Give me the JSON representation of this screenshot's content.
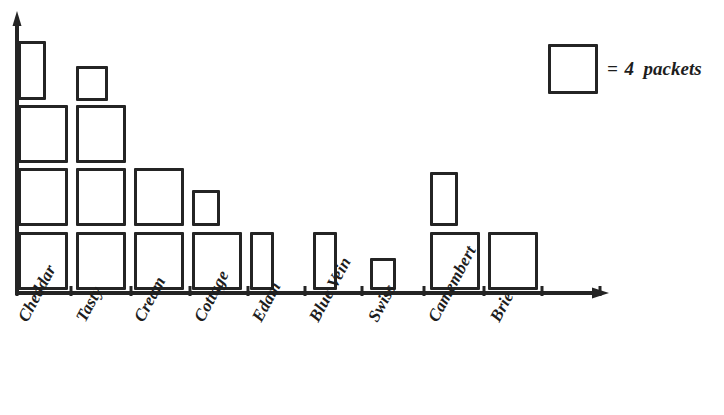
{
  "figure": {
    "kind": "pictograph",
    "ink_color": "#242424",
    "background": "#ffffff"
  },
  "legend": {
    "symbol_name": "packet-square-symbol",
    "equals_sign": "=",
    "value_text": "4",
    "unit_text": "packets",
    "full_text": "= 4  packets"
  },
  "axes": {
    "x_axis_name": "cheese-type-axis",
    "y_axis_name": "packet-count-axis",
    "x_arrow": true,
    "y_arrow": true,
    "gridlines": false,
    "tick_labels": []
  },
  "chart_data": {
    "type": "bar",
    "title": "",
    "subtitle": "",
    "xlabel": "",
    "ylabel": "",
    "legend_position": "top-right",
    "grid": false,
    "symbol_value": 4,
    "symbol_unit": "packets",
    "ylim": [
      0,
      16
    ],
    "categories": [
      "Cheddar",
      "Tasty",
      "Cream",
      "Cottage",
      "Edam",
      "Blue Vein",
      "Swiss",
      "Camembert",
      "Brie"
    ],
    "symbols": [
      3.5,
      3.4,
      2.5,
      1.4,
      0.5,
      0.5,
      0.4,
      1.5,
      1
    ],
    "values": [
      14,
      13,
      10,
      6,
      2,
      2,
      2,
      6,
      4
    ],
    "series": [
      {
        "name": "Packets sold",
        "values": [
          14,
          13,
          10,
          6,
          2,
          2,
          2,
          6,
          4
        ]
      }
    ]
  },
  "plot": {
    "columns": [
      {
        "category": "Cheddar",
        "label": "Cheddar",
        "tick_x": 17,
        "label_x": 14,
        "label_y": 316,
        "boxes": [
          {
            "x": 18,
            "y": 232,
            "w": 50,
            "h": 58
          },
          {
            "x": 18,
            "y": 168,
            "w": 50,
            "h": 58
          },
          {
            "x": 18,
            "y": 105,
            "w": 50,
            "h": 58
          },
          {
            "x": 18,
            "y": 41,
            "w": 28,
            "h": 59
          }
        ]
      },
      {
        "category": "Tasty",
        "label": "Tasty",
        "tick_x": 71,
        "label_x": 72,
        "label_y": 316,
        "boxes": [
          {
            "x": 76,
            "y": 232,
            "w": 50,
            "h": 58
          },
          {
            "x": 76,
            "y": 168,
            "w": 50,
            "h": 58
          },
          {
            "x": 76,
            "y": 105,
            "w": 50,
            "h": 58
          },
          {
            "x": 76,
            "y": 66,
            "w": 32,
            "h": 35
          }
        ]
      },
      {
        "category": "Cream",
        "label": "Cream",
        "tick_x": 131,
        "label_x": 130,
        "label_y": 316,
        "boxes": [
          {
            "x": 134,
            "y": 232,
            "w": 50,
            "h": 58
          },
          {
            "x": 134,
            "y": 168,
            "w": 50,
            "h": 58
          },
          {
            "x": 134,
            "y": 163,
            "w": 26,
            "h": 0
          }
        ]
      },
      {
        "category": "Cottage",
        "label": "Cottage",
        "tick_x": 190,
        "label_x": 190,
        "label_y": 316,
        "boxes": [
          {
            "x": 192,
            "y": 232,
            "w": 50,
            "h": 58
          },
          {
            "x": 192,
            "y": 190,
            "w": 28,
            "h": 36
          }
        ]
      },
      {
        "category": "Edam",
        "label": "Edam",
        "tick_x": 248,
        "label_x": 248,
        "label_y": 316,
        "boxes": [
          {
            "x": 250,
            "y": 232,
            "w": 24,
            "h": 58
          }
        ]
      },
      {
        "category": "Blue Vein",
        "label": "Blue Vein",
        "tick_x": 305,
        "label_x": 305,
        "label_y": 316,
        "boxes": [
          {
            "x": 313,
            "y": 232,
            "w": 24,
            "h": 58
          }
        ]
      },
      {
        "category": "Swiss",
        "label": "Swiss",
        "tick_x": 362,
        "label_x": 364,
        "label_y": 316,
        "boxes": [
          {
            "x": 370,
            "y": 258,
            "w": 26,
            "h": 32
          }
        ]
      },
      {
        "category": "Camembert",
        "label": "Camembert",
        "tick_x": 424,
        "label_x": 424,
        "label_y": 316,
        "boxes": [
          {
            "x": 430,
            "y": 232,
            "w": 50,
            "h": 58
          },
          {
            "x": 430,
            "y": 172,
            "w": 28,
            "h": 54
          }
        ]
      },
      {
        "category": "Brie",
        "label": "Brie",
        "tick_x": 484,
        "label_x": 486,
        "label_y": 316,
        "boxes": [
          {
            "x": 488,
            "y": 232,
            "w": 50,
            "h": 58
          }
        ]
      }
    ],
    "extra_ticks": [
      542,
      600
    ]
  }
}
